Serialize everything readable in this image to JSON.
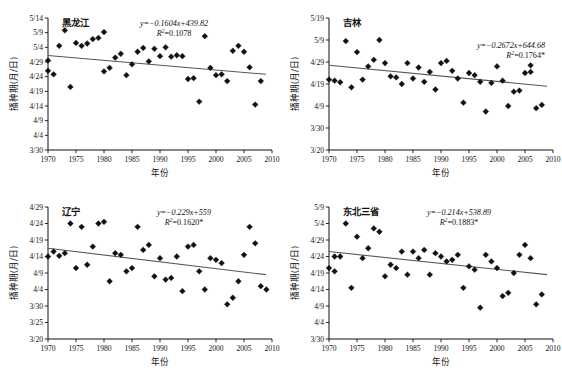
{
  "figure": {
    "x_axis_label": "年份",
    "y_axis_label": "播种期(月/日)",
    "x_ticks": [
      "1970",
      "1975",
      "1980",
      "1985",
      "1990",
      "1995",
      "2000",
      "2005",
      "2010"
    ],
    "x_min": 1970,
    "x_max": 2010,
    "marker_color": "#111111",
    "trend_color": "#555555"
  },
  "chart_data": [
    {
      "type": "scatter",
      "title": "黑龙江",
      "xlabel": "年份",
      "ylabel": "播种期(月/日)",
      "equation": "y=−0.1604x+439.82",
      "r2": "R2=0.1078",
      "slope": -0.1604,
      "intercept": 439.82,
      "xlim": [
        1970,
        2010
      ],
      "ylim": [
        0,
        45
      ],
      "ytick_values": [
        45,
        40,
        35,
        30,
        25,
        20,
        15,
        10,
        5,
        0
      ],
      "ytick_labels": [
        "5/14",
        "5/9",
        "5/4",
        "4/29",
        "4/24",
        "4/19",
        "4/14",
        "4/9",
        "4/4",
        "3/30"
      ],
      "grid": false,
      "trend_y": [
        32.2,
        25.8
      ],
      "points": [
        [
          1970,
          27.0
        ],
        [
          1970,
          30.5
        ],
        [
          1971,
          25.8
        ],
        [
          1972,
          35.5
        ],
        [
          1973,
          40.8
        ],
        [
          1974,
          21.5
        ],
        [
          1975,
          36.5
        ],
        [
          1976,
          35.5
        ],
        [
          1977,
          36.3
        ],
        [
          1978,
          37.8
        ],
        [
          1979,
          38.2
        ],
        [
          1980,
          40.2
        ],
        [
          1980,
          26.8
        ],
        [
          1981,
          28.0
        ],
        [
          1982,
          31.5
        ],
        [
          1983,
          32.8
        ],
        [
          1984,
          25.5
        ],
        [
          1985,
          29.2
        ],
        [
          1986,
          33.5
        ],
        [
          1987,
          34.8
        ],
        [
          1988,
          30.2
        ],
        [
          1989,
          34.5
        ],
        [
          1990,
          32.0
        ],
        [
          1991,
          35.0
        ],
        [
          1992,
          31.8
        ],
        [
          1993,
          32.3
        ],
        [
          1994,
          32.0
        ],
        [
          1995,
          24.2
        ],
        [
          1996,
          24.5
        ],
        [
          1997,
          16.5
        ],
        [
          1998,
          38.8
        ],
        [
          1999,
          28.0
        ],
        [
          2000,
          25.5
        ],
        [
          2001,
          25.8
        ],
        [
          2002,
          23.5
        ],
        [
          2003,
          33.8
        ],
        [
          2004,
          35.5
        ],
        [
          2005,
          33.5
        ],
        [
          2006,
          28.2
        ],
        [
          2007,
          15.5
        ],
        [
          2008,
          23.5
        ]
      ]
    },
    {
      "type": "scatter",
      "title": "吉林",
      "xlabel": "年份",
      "ylabel": "播种期(月/日)",
      "equation": "y=−0.2672x+644.68",
      "r2": "R2=0.1764*",
      "slope": -0.2672,
      "intercept": 644.68,
      "xlim": [
        1970,
        2010
      ],
      "ylim": [
        0,
        60
      ],
      "ytick_values": [
        60,
        50,
        40,
        30,
        20,
        10,
        0
      ],
      "ytick_labels": [
        "5/19",
        "5/9",
        "4/29",
        "4/19",
        "4/9",
        "3/30",
        "3/20"
      ],
      "grid": false,
      "trend_y": [
        38.5,
        29.0
      ],
      "points": [
        [
          1970,
          32.0
        ],
        [
          1971,
          31.5
        ],
        [
          1972,
          30.8
        ],
        [
          1973,
          49.5
        ],
        [
          1974,
          28.5
        ],
        [
          1975,
          44.5
        ],
        [
          1976,
          32.0
        ],
        [
          1977,
          38.0
        ],
        [
          1978,
          41.0
        ],
        [
          1979,
          50.0
        ],
        [
          1980,
          39.5
        ],
        [
          1981,
          33.5
        ],
        [
          1982,
          33.0
        ],
        [
          1983,
          30.0
        ],
        [
          1984,
          39.5
        ],
        [
          1985,
          32.5
        ],
        [
          1986,
          37.5
        ],
        [
          1987,
          31.0
        ],
        [
          1988,
          35.5
        ],
        [
          1989,
          27.5
        ],
        [
          1990,
          39.5
        ],
        [
          1991,
          40.5
        ],
        [
          1992,
          36.0
        ],
        [
          1993,
          32.5
        ],
        [
          1994,
          21.5
        ],
        [
          1995,
          35.0
        ],
        [
          1996,
          34.0
        ],
        [
          1997,
          31.0
        ],
        [
          1998,
          17.5
        ],
        [
          1999,
          30.5
        ],
        [
          2000,
          38.0
        ],
        [
          2001,
          31.5
        ],
        [
          2002,
          20.0
        ],
        [
          2003,
          26.5
        ],
        [
          2004,
          27.0
        ],
        [
          2005,
          35.0
        ],
        [
          2006,
          38.5
        ],
        [
          2006,
          35.5
        ],
        [
          2007,
          19.0
        ],
        [
          2008,
          20.5
        ]
      ]
    },
    {
      "type": "scatter",
      "title": "辽宁",
      "xlabel": "年份",
      "ylabel": "播种期(月/日)",
      "equation": "y=−0.229x+559",
      "r2": "R2=0.1620*",
      "slope": -0.229,
      "intercept": 559,
      "xlim": [
        1970,
        2010
      ],
      "ylim": [
        0,
        40
      ],
      "ytick_values": [
        40,
        35,
        30,
        25,
        20,
        15,
        10,
        5,
        0
      ],
      "ytick_labels": [
        "4/29",
        "4/24",
        "4/19",
        "4/14",
        "4/9",
        "4/4",
        "3/30",
        "3/25",
        "3/20"
      ],
      "grid": false,
      "trend_y": [
        27.5,
        19.5
      ],
      "points": [
        [
          1970,
          25.0
        ],
        [
          1971,
          26.5
        ],
        [
          1972,
          25.2
        ],
        [
          1973,
          26.0
        ],
        [
          1974,
          35.0
        ],
        [
          1975,
          21.5
        ],
        [
          1976,
          34.0
        ],
        [
          1977,
          22.5
        ],
        [
          1978,
          28.0
        ],
        [
          1979,
          35.0
        ],
        [
          1980,
          35.5
        ],
        [
          1981,
          17.5
        ],
        [
          1982,
          26.0
        ],
        [
          1983,
          25.5
        ],
        [
          1984,
          20.5
        ],
        [
          1985,
          21.5
        ],
        [
          1986,
          34.0
        ],
        [
          1987,
          27.0
        ],
        [
          1988,
          28.5
        ],
        [
          1989,
          19.0
        ],
        [
          1990,
          24.5
        ],
        [
          1991,
          18.0
        ],
        [
          1992,
          18.5
        ],
        [
          1993,
          25.0
        ],
        [
          1994,
          14.5
        ],
        [
          1995,
          28.0
        ],
        [
          1996,
          28.5
        ],
        [
          1997,
          20.5
        ],
        [
          1998,
          15.0
        ],
        [
          1999,
          24.5
        ],
        [
          2000,
          24.0
        ],
        [
          2001,
          23.0
        ],
        [
          2002,
          10.5
        ],
        [
          2003,
          12.5
        ],
        [
          2004,
          17.5
        ],
        [
          2005,
          25.5
        ],
        [
          2006,
          34.0
        ],
        [
          2007,
          29.0
        ],
        [
          2008,
          16.0
        ],
        [
          2009,
          15.0
        ]
      ]
    },
    {
      "type": "scatter",
      "title": "东北三省",
      "xlabel": "年份",
      "ylabel": "播种期(月/日)",
      "equation": "y=−0.214x+538.89",
      "r2": "R2=0.1883*",
      "slope": -0.214,
      "intercept": 538.89,
      "xlim": [
        1970,
        2010
      ],
      "ylim": [
        0,
        40
      ],
      "ytick_values": [
        40,
        35,
        30,
        25,
        20,
        15,
        10,
        5,
        0
      ],
      "ytick_labels": [
        "5/9",
        "5/4",
        "4/29",
        "4/24",
        "4/19",
        "4/14",
        "4/9",
        "4/4",
        "3/30"
      ],
      "grid": false,
      "trend_y": [
        26.5,
        19.5
      ],
      "points": [
        [
          1970,
          21.5
        ],
        [
          1971,
          25.0
        ],
        [
          1971,
          20.5
        ],
        [
          1972,
          25.0
        ],
        [
          1973,
          35.0
        ],
        [
          1974,
          15.5
        ],
        [
          1975,
          31.0
        ],
        [
          1976,
          24.5
        ],
        [
          1977,
          27.5
        ],
        [
          1978,
          33.5
        ],
        [
          1979,
          32.5
        ],
        [
          1980,
          19.0
        ],
        [
          1981,
          22.5
        ],
        [
          1982,
          21.5
        ],
        [
          1983,
          26.5
        ],
        [
          1984,
          19.5
        ],
        [
          1985,
          26.5
        ],
        [
          1986,
          24.5
        ],
        [
          1987,
          27.0
        ],
        [
          1988,
          19.5
        ],
        [
          1989,
          26.0
        ],
        [
          1990,
          25.0
        ],
        [
          1991,
          23.5
        ],
        [
          1992,
          24.0
        ],
        [
          1993,
          25.5
        ],
        [
          1994,
          15.5
        ],
        [
          1995,
          22.0
        ],
        [
          1996,
          21.0
        ],
        [
          1997,
          9.5
        ],
        [
          1998,
          25.5
        ],
        [
          1999,
          23.5
        ],
        [
          2000,
          21.5
        ],
        [
          2001,
          13.0
        ],
        [
          2002,
          14.0
        ],
        [
          2003,
          20.0
        ],
        [
          2004,
          25.5
        ],
        [
          2005,
          28.5
        ],
        [
          2006,
          24.5
        ],
        [
          2007,
          10.5
        ],
        [
          2008,
          13.5
        ]
      ]
    }
  ]
}
